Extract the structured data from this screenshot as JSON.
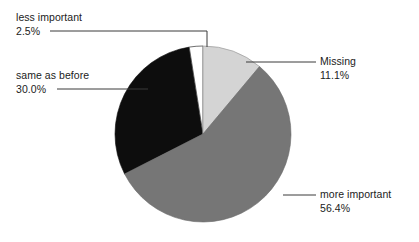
{
  "chart_data": {
    "type": "pie",
    "title": "",
    "subtitle": "",
    "xlabel": "",
    "ylabel": "",
    "legend_position": "callout-labels",
    "grid": false,
    "start_angle_deg": 0,
    "direction": "clockwise",
    "center": {
      "x": 203,
      "y": 134
    },
    "radius": 88,
    "categories": [
      "Missing",
      "more important",
      "same as before",
      "less important"
    ],
    "values": [
      11.1,
      56.4,
      30.0,
      2.5
    ],
    "value_unit": "%",
    "colors": [
      "#d4d4d4",
      "#767676",
      "#0d0d0d",
      "#ffffff"
    ],
    "slices": [
      {
        "label": "Missing",
        "percent_text": "11.1%",
        "value": 11.1,
        "color": "#d4d4d4",
        "start_deg": 0,
        "end_deg": 39.96
      },
      {
        "label": "more important",
        "percent_text": "56.4%",
        "value": 56.4,
        "color": "#767676",
        "start_deg": 39.96,
        "end_deg": 243.0
      },
      {
        "label": "same as before",
        "percent_text": "30.0%",
        "value": 30.0,
        "color": "#0d0d0d",
        "start_deg": 243.0,
        "end_deg": 351.0
      },
      {
        "label": "less important",
        "percent_text": "2.5%",
        "value": 2.5,
        "color": "#ffffff",
        "start_deg": 351.0,
        "end_deg": 360.0
      }
    ]
  },
  "labels": {
    "less_important": {
      "name": "less important",
      "percent": "2.5%"
    },
    "same_as_before": {
      "name": "same as before",
      "percent": "30.0%"
    },
    "missing": {
      "name": "Missing",
      "percent": "11.1%"
    },
    "more_important": {
      "name": "more important",
      "percent": "56.4%"
    }
  },
  "style": {
    "background": "#ffffff",
    "text_color": "#1b1b1b",
    "leader_line_color": "#3a3a3a",
    "slice_outline_color": "#555555"
  }
}
